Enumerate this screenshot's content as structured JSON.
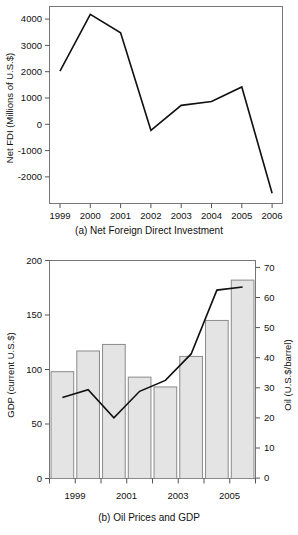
{
  "figure_a": {
    "caption": "(a) Net Foreign Direct Investment",
    "ylabel": "Net FDI (Millions of U.S.$)",
    "ytick_labels": [
      "4000",
      "3000",
      "2000",
      "1000",
      "0",
      "-1000",
      "-2000"
    ],
    "xtick_labels": [
      "1999",
      "2000",
      "2001",
      "2002",
      "2003",
      "2004",
      "2005",
      "2006"
    ]
  },
  "figure_b": {
    "caption": "(b) Oil Prices and GDP",
    "ylabel_left": "GDP (current U.S.$)",
    "ylabel_right": "Oil (U.S.$/barrel)",
    "ytick_labels_left": [
      "200",
      "150",
      "100",
      "50",
      "0"
    ],
    "ytick_labels_right": [
      "70",
      "60",
      "50",
      "40",
      "30",
      "20",
      "10",
      "0"
    ],
    "xtick_labels": [
      "1999",
      "2001",
      "2003",
      "2005"
    ]
  },
  "colors": {
    "line": "#111111",
    "bar_fill": "#e4e4e4",
    "bar_stroke": "#8a8a8a",
    "axis": "#555555",
    "text": "#111111"
  },
  "chart_data": [
    {
      "type": "line",
      "title": "(a) Net Foreign Direct Investment",
      "xlabel": "",
      "ylabel": "Net FDI (Millions of U.S.$)",
      "categories": [
        "1999",
        "2000",
        "2001",
        "2002",
        "2003",
        "2004",
        "2005",
        "2006"
      ],
      "x": [
        1999,
        2000,
        2001,
        2002,
        2003,
        2004,
        2005,
        2006
      ],
      "values": [
        2020,
        4180,
        3480,
        -230,
        720,
        870,
        1420,
        -2620
      ],
      "ylim": [
        -3000,
        4500
      ],
      "yticks": [
        -2000,
        -1000,
        0,
        1000,
        2000,
        3000,
        4000
      ],
      "grid": false,
      "legend": "none"
    },
    {
      "type": "bar",
      "title": "(b) Oil Prices and GDP",
      "xlabel": "",
      "ylabel": "GDP (current U.S.$)",
      "categories": [
        "1999",
        "2000",
        "2001",
        "2002",
        "2003",
        "2004",
        "2005",
        "2006"
      ],
      "series": [
        {
          "name": "GDP (current U.S.$)",
          "type": "bar",
          "axis": "left",
          "values": [
            98,
            117,
            123,
            93,
            84,
            112,
            145,
            182
          ]
        },
        {
          "name": "Oil (U.S.$/barrel)",
          "type": "line",
          "axis": "right",
          "values": [
            26,
            28.5,
            19.5,
            28,
            31.5,
            40,
            60.5,
            61.5
          ]
        }
      ],
      "ylim": [
        0,
        200
      ],
      "yticks": [
        0,
        50,
        100,
        150,
        200
      ],
      "ylim_right": [
        0,
        70
      ],
      "yticks_right": [
        0,
        10,
        20,
        30,
        40,
        50,
        60,
        70
      ],
      "ylabel_right": "Oil (U.S.$/barrel)",
      "xtick_labels_shown": [
        "1999",
        "2001",
        "2003",
        "2005"
      ],
      "grid": false,
      "legend": "none"
    }
  ]
}
